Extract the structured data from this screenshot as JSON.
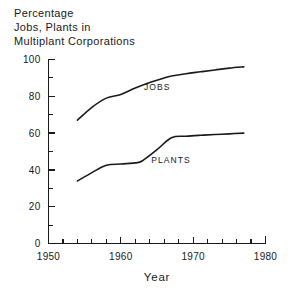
{
  "chart_data": {
    "type": "line",
    "title": "Percentage Jobs, Plants in Multiplant Corporations",
    "title_lines": [
      "Percentage",
      "Jobs, Plants in",
      "Multiplant Corporations"
    ],
    "xlabel": "Year",
    "ylabel": "",
    "xlim": [
      1950,
      1980
    ],
    "ylim": [
      0,
      100
    ],
    "grid": false,
    "legend_position": "inline-annotation",
    "x_ticks_major": [
      "1950",
      "1960",
      "1970",
      "1980"
    ],
    "x_ticks_major_values": [
      1950,
      1960,
      1970,
      1980
    ],
    "x_ticks_minor_values": [
      1952,
      1954,
      1956,
      1958,
      1962,
      1964,
      1966,
      1968,
      1972,
      1974,
      1976,
      1978
    ],
    "y_ticks_major": [
      "0",
      "20",
      "40",
      "60",
      "80",
      "100"
    ],
    "y_ticks_major_values": [
      0,
      20,
      40,
      60,
      80,
      100
    ],
    "y_ticks_minor_values": [
      10,
      30,
      50,
      70,
      90
    ],
    "series": [
      {
        "name": "JOBS",
        "label": "JOBS",
        "label_x": 1963.2,
        "label_y": 83.5,
        "x": [
          1954,
          1956,
          1958,
          1960,
          1962,
          1964,
          1966,
          1967,
          1969,
          1971,
          1973,
          1975,
          1977
        ],
        "values": [
          67,
          74,
          79,
          81,
          84.5,
          87.5,
          90,
          91,
          92.3,
          93.3,
          94.3,
          95.3,
          96
        ]
      },
      {
        "name": "PLANTS",
        "label": "PLANTS",
        "label_x": 1964.2,
        "label_y": 44,
        "x": [
          1954,
          1956,
          1958,
          1960,
          1962,
          1963,
          1965,
          1967,
          1969,
          1971,
          1973,
          1975,
          1977
        ],
        "values": [
          34,
          38.5,
          42.5,
          43.2,
          43.8,
          45,
          51,
          57.5,
          58.3,
          58.8,
          59.2,
          59.6,
          60
        ]
      }
    ]
  }
}
